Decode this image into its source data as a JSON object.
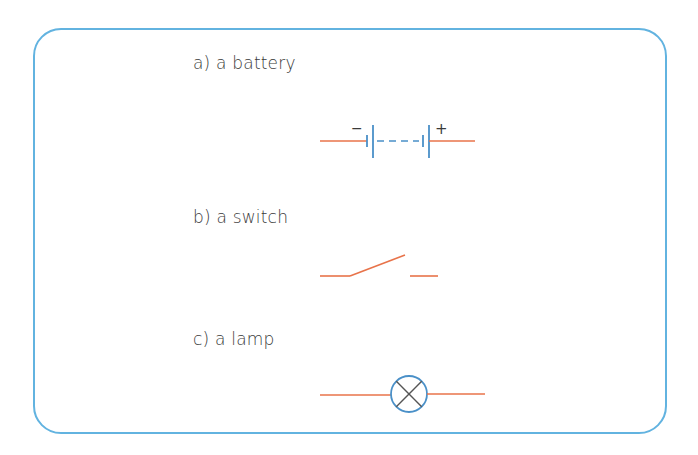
{
  "items": [
    {
      "label": "a) a battery",
      "symbol": "battery",
      "terminals": {
        "negative": "−",
        "positive": "+"
      }
    },
    {
      "label": "b) a switch",
      "symbol": "switch"
    },
    {
      "label": "c) a lamp",
      "symbol": "lamp"
    }
  ],
  "colors": {
    "frame": "#62b3e0",
    "wire": "#e8734a",
    "component": "#4a90c8",
    "text": "#3a3a3a"
  }
}
